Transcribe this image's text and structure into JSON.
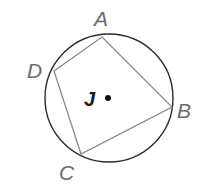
{
  "diagram": {
    "type": "inscribed-quadrilateral",
    "circle": {
      "center_label": "J",
      "cx": 109,
      "cy": 98,
      "r": 64
    },
    "vertices": [
      {
        "label": "A",
        "x": 102,
        "y": 37
      },
      {
        "label": "B",
        "x": 172,
        "y": 107
      },
      {
        "label": "C",
        "x": 81,
        "y": 154
      },
      {
        "label": "D",
        "x": 54,
        "y": 71
      }
    ],
    "labels": {
      "A": "A",
      "B": "B",
      "C": "C",
      "D": "D",
      "J": "J"
    },
    "colors": {
      "circle": "#2b2b2b",
      "polygon": "#8a8a8a",
      "label": "#6b6b6b",
      "center": "#111111"
    }
  }
}
